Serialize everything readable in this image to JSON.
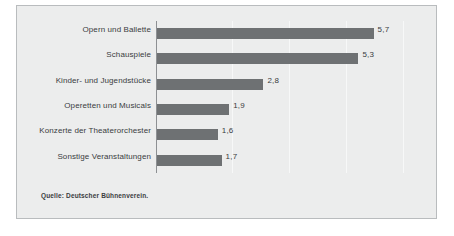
{
  "chart_data": {
    "type": "bar",
    "orientation": "horizontal",
    "title": "",
    "subtitle": "",
    "xlabel": "",
    "ylabel": "",
    "grid": true,
    "grid_axis": "x",
    "legend": false,
    "legend_position": "none",
    "xlim": [
      0,
      7
    ],
    "gridline_values": [
      2,
      3.5,
      5,
      6.5
    ],
    "categories": [
      "Opern und Ballette",
      "Schauspiele",
      "Kinder- und Jugendstücke",
      "Operetten und Musicals",
      "Konzerte der Theaterorchester",
      "Sonstige Veranstaltungen"
    ],
    "values": [
      5.7,
      5.3,
      2.8,
      1.9,
      1.6,
      1.7
    ],
    "value_labels": [
      "5,7",
      "5,3",
      "2,8",
      "1,9",
      "1,6",
      "1,7"
    ],
    "bars": [
      {
        "category": "Opern und Ballette",
        "value": 5.7,
        "label": "5,7"
      },
      {
        "category": "Schauspiele",
        "value": 5.3,
        "label": "5,3"
      },
      {
        "category": "Kinder- und Jugendstücke",
        "value": 2.8,
        "label": "2,8"
      },
      {
        "category": "Operetten und Musicals",
        "value": 1.9,
        "label": "1,9"
      },
      {
        "category": "Konzerte der Theaterorchester",
        "value": 1.6,
        "label": "1,6"
      },
      {
        "category": "Sonstige Veranstaltungen",
        "value": 1.7,
        "label": "1,7"
      }
    ],
    "colors": {
      "bar": "#6e7173",
      "panel_background": "#eceded",
      "panel_border": "#b9bcbe",
      "axis_line": "#8d9093",
      "gridline": "#f7f8f8",
      "text": "#3a3c3e"
    }
  },
  "source": {
    "note": "Quelle: Deutscher Bühnenverein."
  }
}
